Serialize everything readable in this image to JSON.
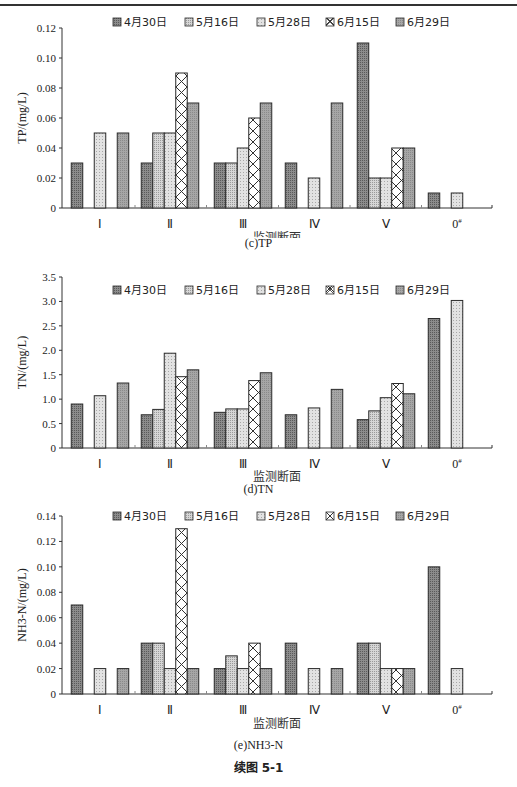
{
  "page": {
    "figure_caption": "续图 5-1"
  },
  "legend": [
    {
      "label": "4月30日",
      "pattern": "dark-dots"
    },
    {
      "label": "5月16日",
      "pattern": "light-dots"
    },
    {
      "label": "5月28日",
      "pattern": "light-fine"
    },
    {
      "label": "6月15日",
      "pattern": "crosshatch"
    },
    {
      "label": "6月29日",
      "pattern": "gray"
    }
  ],
  "colors": {
    "axis": "#333333",
    "bar_stroke": "#2a2a2a",
    "dark_fill": "#8c8c8c",
    "light_fill": "#d6d6d6",
    "gray_fill": "#a6a6a6"
  },
  "chart_data": [
    {
      "type": "bar",
      "title": "(c)TP",
      "xlabel": "监测断面",
      "ylabel": "TP/(mg/L)",
      "ylim": [
        0,
        0.12
      ],
      "yticks": [
        "0",
        "0.02",
        "0.04",
        "0.06",
        "0.08",
        "0.10",
        "0.12"
      ],
      "ytick_values": [
        0,
        0.02,
        0.04,
        0.06,
        0.08,
        0.1,
        0.12
      ],
      "categories": [
        "Ⅰ",
        "Ⅱ",
        "Ⅲ",
        "Ⅳ",
        "Ⅴ",
        "0#"
      ],
      "legend_position": "top",
      "grid": false,
      "series": [
        {
          "name": "4月30日",
          "values": [
            0.03,
            0.03,
            0.03,
            0.03,
            0.11,
            0.01
          ]
        },
        {
          "name": "5月16日",
          "values": [
            null,
            0.05,
            0.03,
            null,
            0.02,
            null
          ]
        },
        {
          "name": "5月28日",
          "values": [
            0.05,
            0.05,
            0.04,
            0.02,
            0.02,
            0.01
          ]
        },
        {
          "name": "6月15日",
          "values": [
            null,
            0.09,
            0.06,
            null,
            0.04,
            null
          ]
        },
        {
          "name": "6月29日",
          "values": [
            0.05,
            0.07,
            0.07,
            0.07,
            0.04,
            null
          ]
        }
      ]
    },
    {
      "type": "bar",
      "title": "(d)TN",
      "xlabel": "监测断面",
      "ylabel": "TN/(mg/L)",
      "ylim": [
        0,
        3.5
      ],
      "yticks": [
        "0",
        "0.5",
        "1.0",
        "1.5",
        "2.0",
        "2.5",
        "3.0",
        "3.5"
      ],
      "ytick_values": [
        0,
        0.5,
        1.0,
        1.5,
        2.0,
        2.5,
        3.0,
        3.5
      ],
      "categories": [
        "Ⅰ",
        "Ⅱ",
        "Ⅲ",
        "Ⅳ",
        "Ⅴ",
        "0#"
      ],
      "legend_position": "top",
      "grid": false,
      "series": [
        {
          "name": "4月30日",
          "values": [
            0.9,
            0.68,
            0.73,
            0.68,
            0.58,
            2.65
          ]
        },
        {
          "name": "5月16日",
          "values": [
            null,
            0.79,
            0.8,
            null,
            0.76,
            null
          ]
        },
        {
          "name": "5月28日",
          "values": [
            1.07,
            1.94,
            0.8,
            0.82,
            1.03,
            3.02
          ]
        },
        {
          "name": "6月15日",
          "values": [
            null,
            1.46,
            1.38,
            null,
            1.32,
            null
          ]
        },
        {
          "name": "6月29日",
          "values": [
            1.33,
            1.6,
            1.54,
            1.2,
            1.11,
            null
          ]
        }
      ]
    },
    {
      "type": "bar",
      "title": "(e)NH3-N",
      "xlabel": "监测断面",
      "ylabel": "NH3-N/(mg/L)",
      "ylim": [
        0,
        0.14
      ],
      "yticks": [
        "0",
        "0.02",
        "0.04",
        "0.06",
        "0.08",
        "0.10",
        "0.12",
        "0.14"
      ],
      "ytick_values": [
        0,
        0.02,
        0.04,
        0.06,
        0.08,
        0.1,
        0.12,
        0.14
      ],
      "categories": [
        "Ⅰ",
        "Ⅱ",
        "Ⅲ",
        "Ⅳ",
        "Ⅴ",
        "0#"
      ],
      "legend_position": "top",
      "grid": false,
      "series": [
        {
          "name": "4月30日",
          "values": [
            0.07,
            0.04,
            0.02,
            0.04,
            0.04,
            0.1
          ]
        },
        {
          "name": "5月16日",
          "values": [
            null,
            0.04,
            0.03,
            null,
            0.04,
            null
          ]
        },
        {
          "name": "5月28日",
          "values": [
            0.02,
            0.02,
            0.02,
            0.02,
            0.02,
            0.02
          ]
        },
        {
          "name": "6月15日",
          "values": [
            null,
            0.13,
            0.04,
            null,
            0.02,
            null
          ]
        },
        {
          "name": "6月29日",
          "values": [
            0.02,
            0.02,
            0.02,
            0.02,
            0.02,
            null
          ]
        }
      ]
    }
  ]
}
